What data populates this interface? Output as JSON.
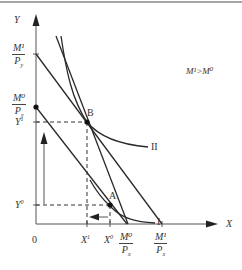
{
  "figure": {
    "y_axis_label": "Y",
    "x_axis_label": "X",
    "origin_label": "0",
    "condition": "M¹>M⁰",
    "y_intercepts": [
      {
        "num": "M¹",
        "den": "P",
        "den_sub": "y"
      },
      {
        "num": "M⁰",
        "den": "P",
        "den_sub": "y"
      }
    ],
    "x_intercepts": [
      {
        "num": "M⁰",
        "den": "P",
        "den_sub": "x"
      },
      {
        "num": "M¹",
        "den": "P",
        "den_sub": "x"
      }
    ],
    "y_levels": [
      {
        "label": "Y",
        "sup": "1"
      },
      {
        "label": "Y",
        "sup": "0"
      }
    ],
    "x_levels": [
      {
        "label": "X",
        "sup": "1"
      },
      {
        "label": "X",
        "sup": "0"
      }
    ],
    "points": [
      {
        "label": "B"
      },
      {
        "label": "A"
      }
    ],
    "curves": [
      {
        "label": "II"
      },
      {
        "label": "I"
      }
    ]
  },
  "colors": {
    "line": "#2a2a2a",
    "axis": "#555555",
    "text": "#333333",
    "border": "#888888"
  }
}
